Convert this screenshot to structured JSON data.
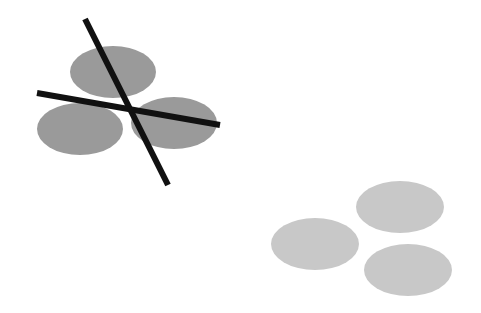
{
  "figure": {
    "width": 481,
    "height": 313,
    "background": "#ffffff",
    "crossed_group": {
      "fill": "#9a9a9a",
      "ellipses": [
        {
          "cx": 113,
          "cy": 72,
          "rx": 43,
          "ry": 26
        },
        {
          "cx": 80,
          "cy": 129,
          "rx": 43,
          "ry": 26
        },
        {
          "cx": 174,
          "cy": 123,
          "rx": 43,
          "ry": 26
        }
      ],
      "lines": {
        "color": "#111111",
        "width": 6,
        "items": [
          {
            "x1": 85,
            "y1": 19,
            "x2": 168,
            "y2": 185
          },
          {
            "x1": 37,
            "y1": 93,
            "x2": 220,
            "y2": 125
          }
        ]
      }
    },
    "plain_group": {
      "fill": "#c8c8c8",
      "ellipses": [
        {
          "cx": 400,
          "cy": 207,
          "rx": 44,
          "ry": 26
        },
        {
          "cx": 315,
          "cy": 244,
          "rx": 44,
          "ry": 26
        },
        {
          "cx": 408,
          "cy": 270,
          "rx": 44,
          "ry": 26
        }
      ]
    }
  }
}
